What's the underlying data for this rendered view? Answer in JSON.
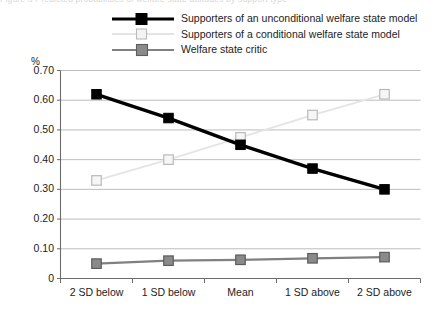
{
  "figure": {
    "clipped_top_text": "Figure 3  Predicted probabilities of welfare state attitudes by support type",
    "y_unit_label": "%"
  },
  "legend": {
    "position": "top",
    "entries": [
      {
        "label": "Supporters of an unconditional welfare state model",
        "color": "#000000",
        "marker": "filled-square",
        "line_width": "3.2"
      },
      {
        "label": "Supporters of a conditional welfare state model",
        "color": "#e2e2e2",
        "marker": "open-square",
        "line_width": "1.6"
      },
      {
        "label": "Welfare state critic",
        "color": "#808080",
        "marker": "filled-square",
        "line_width": "2.2"
      }
    ]
  },
  "chart_data": {
    "type": "line",
    "title": "",
    "subtitle": "",
    "xlabel": "",
    "ylabel": "%",
    "categories": [
      "2 SD below",
      "1 SD below",
      "Mean",
      "1 SD above",
      "2 SD above"
    ],
    "ylim": [
      0,
      0.7
    ],
    "ytick_labels": [
      "0.70",
      "0.60",
      "0.50",
      "0.40",
      "0.30",
      "0.20",
      "0.10",
      "0"
    ],
    "ytick_values": [
      0.7,
      0.6,
      0.5,
      0.4,
      0.3,
      0.2,
      0.1,
      0
    ],
    "grid": true,
    "grid_axis": "y",
    "legend_position": "top",
    "series": [
      {
        "name": "Supporters of an unconditional welfare state model",
        "color": "#000000",
        "marker": "filled-square",
        "values": [
          0.62,
          0.54,
          0.45,
          0.37,
          0.3
        ]
      },
      {
        "name": "Supporters of a conditional welfare state model",
        "color": "#e2e2e2",
        "marker": "open-square",
        "values": [
          0.33,
          0.4,
          0.475,
          0.55,
          0.62
        ]
      },
      {
        "name": "Welfare state critic",
        "color": "#808080",
        "marker": "filled-square",
        "values": [
          0.05,
          0.06,
          0.063,
          0.068,
          0.072
        ]
      }
    ]
  }
}
